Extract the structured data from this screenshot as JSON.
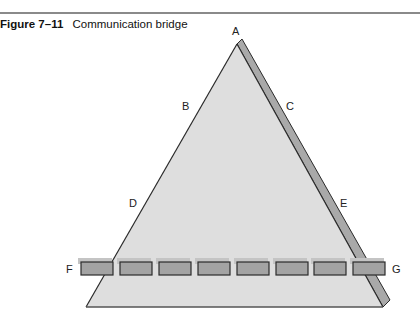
{
  "figure": {
    "number": "Figure 7–11",
    "title": "Communication bridge"
  },
  "diagram": {
    "type": "triangle-with-bridge",
    "labels": {
      "apex": "A",
      "upper_left": "B",
      "upper_right": "C",
      "lower_left": "D",
      "lower_right": "E",
      "bridge_left": "F",
      "bridge_right": "G"
    },
    "bridge_box_count": 8,
    "colors": {
      "triangle_fill": "#dedede",
      "triangle_edge": "#2a2a2a",
      "shadow_fill": "#a9a9a9",
      "box_fill": "#a3a3a3",
      "box_border": "#2b2b2b",
      "box_shadow": "#c4c4c4"
    }
  }
}
